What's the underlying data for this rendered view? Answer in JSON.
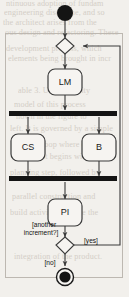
{
  "figure": {
    "type": "uml-activity-diagram",
    "background_color": "#f2f0ec",
    "line_color": "#3a3a3a",
    "fill_color": "#f6f4f1",
    "bar_color": "#141414"
  },
  "nodes": {
    "initial": {
      "kind": "initial-node",
      "label": ""
    },
    "merge": {
      "kind": "merge-node",
      "label": ""
    },
    "activity_lm": {
      "kind": "activity",
      "label": "LM"
    },
    "fork": {
      "kind": "fork-bar",
      "label": ""
    },
    "activity_cs": {
      "kind": "activity",
      "label": "CS"
    },
    "activity_b": {
      "kind": "activity",
      "label": "B"
    },
    "join": {
      "kind": "join-bar",
      "label": ""
    },
    "activity_pi": {
      "kind": "activity",
      "label": "PI"
    },
    "decision": {
      "kind": "decision-node",
      "label": ""
    },
    "final": {
      "kind": "final-node",
      "label": ""
    }
  },
  "guards": {
    "question_line1": "[another",
    "question_line2": "increment?]",
    "yes": "[yes]",
    "no": "[no]"
  },
  "background_text": {
    "lines": [
      "ntinuous adoption of fundam",
      "engineering discipline, and so",
      "the architect arises from the",
      "ous design and refactoring. These",
      "development process, which",
      "elements being brought in incr"
    ],
    "lines_mid": [
      "able 3. UML Activity",
      "model of this process",
      "hown in the figure to",
      "left. It is governed by a simple",
      "iterative loop where each",
      "increment begins with a",
      "planning step, followed by",
      "parallel construction and",
      "build activities, before the",
      "integration of the product."
    ]
  }
}
